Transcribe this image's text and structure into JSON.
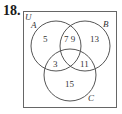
{
  "problem": {
    "number": "18."
  },
  "venn": {
    "universe_label": "U",
    "sets": [
      {
        "label": "A"
      },
      {
        "label": "B"
      },
      {
        "label": "C"
      }
    ],
    "regions": {
      "A_only": "5",
      "A_and_B_only": "7 9",
      "B_only": "13",
      "A_and_C_only": "3",
      "B_and_C_only": "11",
      "C_only": "15"
    },
    "colors": {
      "stroke": "#555555",
      "text": "#333333"
    }
  }
}
